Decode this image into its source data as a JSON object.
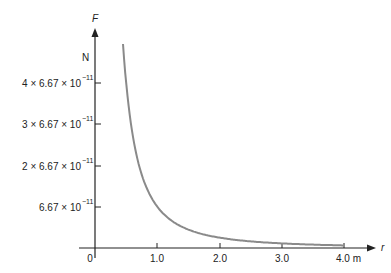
{
  "chart_data": {
    "type": "line",
    "title": "",
    "xlabel": "r",
    "x_unit": "m",
    "ylabel": "F",
    "y_unit": "N",
    "x_ticks": [
      "0",
      "1.0",
      "2.0",
      "3.0",
      "4.0 m"
    ],
    "x_tick_values": [
      0,
      1,
      2,
      3,
      4
    ],
    "y_ticks": [
      "6.67 × 10⁻¹¹",
      "2 × 6.67 × 10⁻¹¹",
      "3 × 6.67 × 10⁻¹¹",
      "4 × 6.67 × 10⁻¹¹"
    ],
    "y_tick_values": [
      6.67e-11,
      1.334e-10,
      2.001e-10,
      2.668e-10
    ],
    "series": [
      {
        "name": "F = G/r²",
        "x": [
          0.45,
          0.5,
          0.6,
          0.7,
          0.8,
          1.0,
          1.25,
          1.5,
          2.0,
          2.5,
          3.0,
          3.5,
          4.0
        ],
        "y_in_units_of_6.67e-11": [
          4.94,
          4.0,
          2.78,
          2.04,
          1.56,
          1.0,
          0.64,
          0.44,
          0.25,
          0.16,
          0.11,
          0.08,
          0.0625
        ]
      }
    ],
    "xlim": [
      0,
      4.5
    ],
    "ylim": [
      0,
      5
    ],
    "grid": false,
    "legend": "none"
  },
  "labels": {
    "y_axis": "F",
    "y_unit": "N",
    "x_axis": "r",
    "y_tick_4_coef": "4 × 6.67 × 10",
    "y_tick_3_coef": "3 × 6.67 × 10",
    "y_tick_2_coef": "2 × 6.67 × 10",
    "y_tick_1_coef": "6.67 × 10",
    "exponent": "−11",
    "x_tick_0": "0",
    "x_tick_1": "1.0",
    "x_tick_2": "2.0",
    "x_tick_3": "3.0",
    "x_tick_4": "4.0 m"
  },
  "colors": {
    "curve": "#8a8a8a",
    "axis": "#222222"
  }
}
